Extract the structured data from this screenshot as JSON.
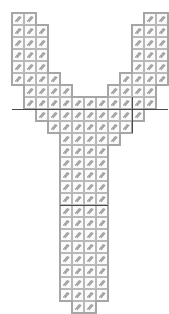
{
  "document": {
    "title": "Knitting Stitch Chart",
    "shape_name": "Y-shaped gusset pattern",
    "background_color": "#ffffff",
    "cell_fill_color": "#fbfbfb",
    "cell_border_color": "#b9b9b9",
    "outline_color": "#a6a6a6",
    "marker_color": "#4a4a4a",
    "symbol_color": "#9a9a9a",
    "symbol_name": "diagonal-decrease-symbol"
  },
  "grid": {
    "cell_width": 12,
    "cell_height": 12,
    "origin_x": 12,
    "origin_y": 13,
    "columns": 13,
    "rows": 25
  },
  "chart_data": {
    "type": "heatmap",
    "title": "Y-shaped gusset pattern",
    "xlabel": "",
    "ylabel": "",
    "legend": [],
    "row_labels": [
      1,
      2,
      3,
      4,
      5,
      6,
      7,
      8,
      9,
      10,
      11,
      12,
      13,
      14,
      15,
      16,
      17,
      18,
      19,
      20,
      21,
      22,
      23,
      24,
      25
    ],
    "column_labels": [
      1,
      2,
      3,
      4,
      5,
      6,
      7,
      8,
      9,
      10,
      11,
      12,
      13
    ],
    "rows": [
      {
        "row": 1,
        "segments": [
          {
            "start": 0,
            "count": 2
          },
          {
            "start": 11,
            "count": 2
          }
        ]
      },
      {
        "row": 2,
        "segments": [
          {
            "start": 0,
            "count": 3
          },
          {
            "start": 10,
            "count": 3
          }
        ]
      },
      {
        "row": 3,
        "segments": [
          {
            "start": 0,
            "count": 3
          },
          {
            "start": 10,
            "count": 3
          }
        ]
      },
      {
        "row": 4,
        "segments": [
          {
            "start": 0,
            "count": 3
          },
          {
            "start": 10,
            "count": 3
          }
        ]
      },
      {
        "row": 5,
        "segments": [
          {
            "start": 0,
            "count": 3
          },
          {
            "start": 10,
            "count": 3
          }
        ]
      },
      {
        "row": 6,
        "segments": [
          {
            "start": 0,
            "count": 4
          },
          {
            "start": 9,
            "count": 4
          }
        ]
      },
      {
        "row": 7,
        "segments": [
          {
            "start": 1,
            "count": 4
          },
          {
            "start": 8,
            "count": 4
          }
        ]
      },
      {
        "row": 8,
        "segments": [
          {
            "start": 1,
            "count": 11
          }
        ]
      },
      {
        "row": 9,
        "segments": [
          {
            "start": 2,
            "count": 9
          }
        ]
      },
      {
        "row": 10,
        "segments": [
          {
            "start": 3,
            "count": 7
          }
        ]
      },
      {
        "row": 11,
        "segments": [
          {
            "start": 4,
            "count": 5
          }
        ]
      },
      {
        "row": 12,
        "segments": [
          {
            "start": 4,
            "count": 4
          }
        ]
      },
      {
        "row": 13,
        "segments": [
          {
            "start": 4,
            "count": 4
          }
        ]
      },
      {
        "row": 14,
        "segments": [
          {
            "start": 4,
            "count": 4
          }
        ]
      },
      {
        "row": 15,
        "segments": [
          {
            "start": 4,
            "count": 4
          }
        ]
      },
      {
        "row": 16,
        "segments": [
          {
            "start": 4,
            "count": 4
          }
        ]
      },
      {
        "row": 17,
        "segments": [
          {
            "start": 4,
            "count": 4
          }
        ]
      },
      {
        "row": 18,
        "segments": [
          {
            "start": 4,
            "count": 4
          }
        ]
      },
      {
        "row": 19,
        "segments": [
          {
            "start": 4,
            "count": 4
          }
        ]
      },
      {
        "row": 20,
        "segments": [
          {
            "start": 4,
            "count": 4
          }
        ]
      },
      {
        "row": 21,
        "segments": [
          {
            "start": 4,
            "count": 4
          }
        ]
      },
      {
        "row": 22,
        "segments": [
          {
            "start": 4,
            "count": 4
          }
        ]
      },
      {
        "row": 23,
        "segments": [
          {
            "start": 4,
            "count": 4
          }
        ]
      },
      {
        "row": 24,
        "segments": [
          {
            "start": 4,
            "count": 4
          }
        ]
      },
      {
        "row": 25,
        "segments": [
          {
            "start": 5,
            "count": 2
          }
        ]
      }
    ],
    "markers": {
      "horizontal": [
        {
          "row_boundary": 8,
          "col_start": 0,
          "col_end": 13
        },
        {
          "row_boundary": 16,
          "col_start": 4,
          "col_end": 8
        }
      ],
      "vertical": [
        {
          "col_boundary": 10,
          "row_start": 7,
          "row_end": 10
        }
      ]
    }
  }
}
